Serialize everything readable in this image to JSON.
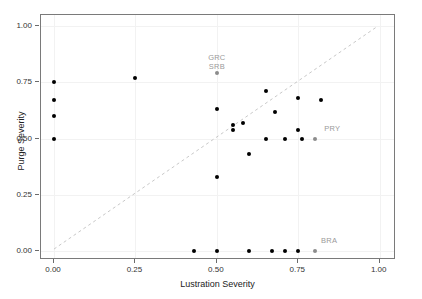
{
  "chart_data": {
    "type": "scatter",
    "title": "",
    "xlabel": "Lustration Severity",
    "ylabel": "Purge Severity",
    "xlim": [
      -0.04,
      1.05
    ],
    "ylim": [
      -0.04,
      1.05
    ],
    "grid": true,
    "legend": null,
    "xticks": [
      0.0,
      0.25,
      0.5,
      0.75,
      1.0
    ],
    "xticklabels": [
      "0.00",
      "0.25",
      "0.50",
      "0.75",
      "1.00"
    ],
    "yticks": [
      0.0,
      0.25,
      0.5,
      0.75,
      1.0
    ],
    "yticklabels": [
      "0.00",
      "0.25",
      "0.50",
      "0.75",
      "1.00"
    ],
    "reference_line": {
      "type": "dashed-diagonal",
      "from": [
        0.0,
        0.0
      ],
      "to": [
        1.0,
        1.0
      ],
      "color": "#c8c8c8",
      "style": "dashed"
    },
    "point_color": "#000000",
    "highlight_color": "#8c8c8c",
    "points": [
      {
        "x": 0.0,
        "y": 0.75,
        "label": ""
      },
      {
        "x": 0.0,
        "y": 0.67,
        "label": ""
      },
      {
        "x": 0.0,
        "y": 0.6,
        "label": ""
      },
      {
        "x": 0.0,
        "y": 0.5,
        "label": ""
      },
      {
        "x": 0.25,
        "y": 0.77,
        "label": ""
      },
      {
        "x": 0.5,
        "y": 0.79,
        "label": "GRC SRB",
        "highlight": true
      },
      {
        "x": 0.5,
        "y": 0.63,
        "label": ""
      },
      {
        "x": 0.5,
        "y": 0.33,
        "label": ""
      },
      {
        "x": 0.55,
        "y": 0.56,
        "label": ""
      },
      {
        "x": 0.55,
        "y": 0.54,
        "label": ""
      },
      {
        "x": 0.58,
        "y": 0.57,
        "label": ""
      },
      {
        "x": 0.6,
        "y": 0.43,
        "label": ""
      },
      {
        "x": 0.65,
        "y": 0.71,
        "label": ""
      },
      {
        "x": 0.65,
        "y": 0.5,
        "label": ""
      },
      {
        "x": 0.68,
        "y": 0.62,
        "label": ""
      },
      {
        "x": 0.71,
        "y": 0.5,
        "label": ""
      },
      {
        "x": 0.75,
        "y": 0.68,
        "label": ""
      },
      {
        "x": 0.75,
        "y": 0.54,
        "label": "PRY"
      },
      {
        "x": 0.76,
        "y": 0.5,
        "label": ""
      },
      {
        "x": 0.8,
        "y": 0.5,
        "label": "PRY",
        "highlight": true
      },
      {
        "x": 0.82,
        "y": 0.67,
        "label": ""
      },
      {
        "x": 0.43,
        "y": 0.0,
        "label": ""
      },
      {
        "x": 0.5,
        "y": 0.0,
        "label": ""
      },
      {
        "x": 0.6,
        "y": 0.0,
        "label": ""
      },
      {
        "x": 0.67,
        "y": 0.0,
        "label": ""
      },
      {
        "x": 0.71,
        "y": 0.0,
        "label": ""
      },
      {
        "x": 0.75,
        "y": 0.0,
        "label": ""
      },
      {
        "x": 0.8,
        "y": 0.0,
        "label": "BRA",
        "highlight": true
      }
    ],
    "annotations": [
      {
        "text": "GRC",
        "x": 0.5,
        "y": 0.86
      },
      {
        "text": "SRB",
        "x": 0.5,
        "y": 0.82
      },
      {
        "text": "PRY",
        "x": 0.83,
        "y": 0.545
      },
      {
        "text": "BRA",
        "x": 0.82,
        "y": 0.045
      }
    ]
  }
}
